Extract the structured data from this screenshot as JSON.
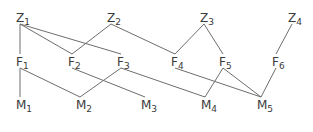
{
  "diagram": {
    "type": "layered-graph",
    "layers": [
      {
        "name": "Z",
        "nodes": [
          {
            "id": "Z1",
            "base": "Z",
            "sub": "1",
            "x": 20,
            "y": 22
          },
          {
            "id": "Z2",
            "base": "Z",
            "sub": "2",
            "x": 111,
            "y": 22
          },
          {
            "id": "Z3",
            "base": "Z",
            "sub": "3",
            "x": 204,
            "y": 22
          },
          {
            "id": "Z4",
            "base": "Z",
            "sub": "4",
            "x": 292,
            "y": 22
          }
        ]
      },
      {
        "name": "F",
        "nodes": [
          {
            "id": "F1",
            "base": "F",
            "sub": "1",
            "x": 20,
            "y": 66
          },
          {
            "id": "F2",
            "base": "F",
            "sub": "2",
            "x": 72,
            "y": 66
          },
          {
            "id": "F3",
            "base": "F",
            "sub": "3",
            "x": 121,
            "y": 66
          },
          {
            "id": "F4",
            "base": "F",
            "sub": "4",
            "x": 175,
            "y": 66
          },
          {
            "id": "F5",
            "base": "F",
            "sub": "5",
            "x": 223,
            "y": 66
          },
          {
            "id": "F6",
            "base": "F",
            "sub": "6",
            "x": 276,
            "y": 66
          }
        ]
      },
      {
        "name": "M",
        "nodes": [
          {
            "id": "M1",
            "base": "M",
            "sub": "1",
            "x": 20,
            "y": 109
          },
          {
            "id": "M2",
            "base": "M",
            "sub": "2",
            "x": 80,
            "y": 109
          },
          {
            "id": "M3",
            "base": "M",
            "sub": "3",
            "x": 145,
            "y": 109
          },
          {
            "id": "M4",
            "base": "M",
            "sub": "4",
            "x": 205,
            "y": 109
          },
          {
            "id": "M5",
            "base": "M",
            "sub": "5",
            "x": 261,
            "y": 109
          }
        ]
      }
    ],
    "edges": [
      [
        "Z1",
        "F1"
      ],
      [
        "Z1",
        "F2"
      ],
      [
        "Z1",
        "F3"
      ],
      [
        "Z2",
        "F2"
      ],
      [
        "Z2",
        "F4"
      ],
      [
        "Z3",
        "F4"
      ],
      [
        "Z3",
        "F5"
      ],
      [
        "Z4",
        "F6"
      ],
      [
        "F1",
        "M1"
      ],
      [
        "F1",
        "M2"
      ],
      [
        "F2",
        "M3"
      ],
      [
        "F3",
        "M2"
      ],
      [
        "F3",
        "M4"
      ],
      [
        "F4",
        "M5"
      ],
      [
        "F5",
        "M4"
      ],
      [
        "F5",
        "M5"
      ],
      [
        "F6",
        "M5"
      ]
    ],
    "colors": {
      "edge": "#6e6e6e",
      "label": "#3a3a3a",
      "background": "#ffffff"
    }
  }
}
